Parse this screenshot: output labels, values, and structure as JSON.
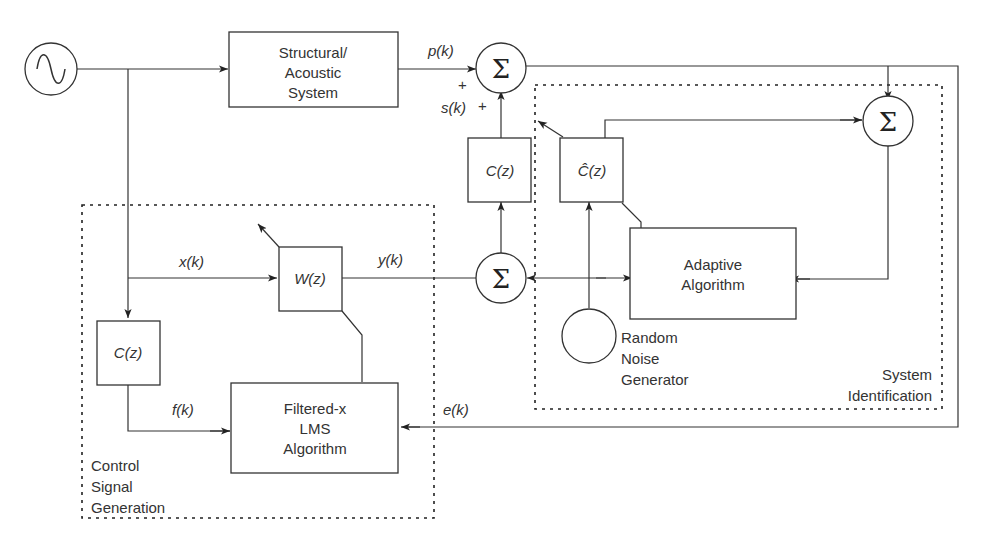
{
  "diagram": {
    "title": "",
    "blocks": {
      "plant": [
        "Structural/",
        "Acoustic",
        "System"
      ],
      "secondary_path": "C(z)",
      "secondary_path_estimate": "Ĉ(z)",
      "secondary_path_filter": "C(z)",
      "adaptive_filter": "W(z)",
      "fxlms": [
        "Filtered-x",
        "LMS",
        "Algorithm"
      ],
      "adaptive_algorithm": [
        "Adaptive",
        "Algorithm"
      ],
      "noise_generator": [
        "Random",
        "Noise",
        "Generator"
      ]
    },
    "summing_junction_symbol": "Σ",
    "signals": {
      "p": "p(k)",
      "s": "s(k)",
      "x": "x(k)",
      "y": "y(k)",
      "f": "f(k)",
      "e": "e(k)",
      "plus1": "+",
      "plus2": "+"
    },
    "regions": {
      "control": [
        "Control",
        "Signal",
        "Generation"
      ],
      "sysid": [
        "System",
        "Identification"
      ]
    }
  }
}
